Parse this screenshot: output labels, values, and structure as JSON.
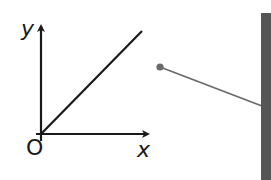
{
  "diagram": {
    "graph": {
      "y_axis_label": "y",
      "x_axis_label": "x",
      "origin_label": "O",
      "line": {
        "description": "straight line through origin",
        "color": "#1a1a1a"
      }
    },
    "object": {
      "description": "ball on string attached to wall",
      "ball_color": "#6a6a6a",
      "string_color": "#6a6a6a"
    },
    "wall": {
      "color": "#555555"
    }
  }
}
